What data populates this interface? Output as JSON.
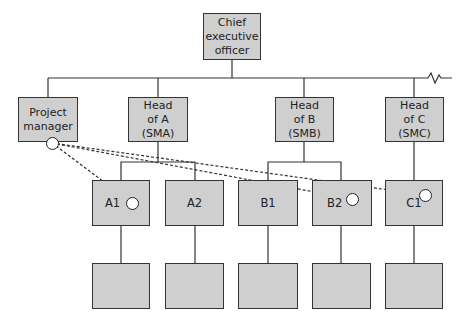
{
  "diagram": {
    "type": "matrix organisation chart",
    "top": {
      "label": "Chief\nexecutive\nofficer"
    },
    "level2": [
      {
        "id": "pm",
        "label": "Project\nmanager"
      },
      {
        "id": "sma",
        "label": "Head\nof A\n(SMA)"
      },
      {
        "id": "smb",
        "label": "Head\nof B\n(SMB)"
      },
      {
        "id": "smc",
        "label": "Head\nof C\n(SMC)"
      }
    ],
    "level3": [
      {
        "id": "a1",
        "label": "A1",
        "parent": "sma"
      },
      {
        "id": "a2",
        "label": "A2",
        "parent": "sma"
      },
      {
        "id": "b1",
        "label": "B1",
        "parent": "smb"
      },
      {
        "id": "b2",
        "label": "B2",
        "parent": "smb"
      },
      {
        "id": "c1",
        "label": "C1",
        "parent": "smc"
      }
    ],
    "level4": [
      {
        "id": "a1-sub",
        "label": ""
      },
      {
        "id": "a2-sub",
        "label": ""
      },
      {
        "id": "b1-sub",
        "label": ""
      },
      {
        "id": "b2-sub",
        "label": ""
      },
      {
        "id": "c1-sub",
        "label": ""
      }
    ],
    "dashed_links": [
      {
        "from": "pm",
        "to": "a1"
      },
      {
        "from": "pm",
        "to": "b2"
      },
      {
        "from": "pm",
        "to": "c1"
      }
    ],
    "colors": {
      "box_fill": "#cfcfcf",
      "line": "#333333"
    }
  }
}
